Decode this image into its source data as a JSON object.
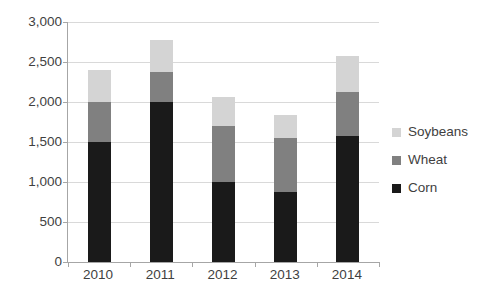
{
  "chart_data": {
    "type": "bar",
    "subtype": "stacked-bar",
    "title": "",
    "xlabel": "",
    "ylabel": "",
    "categories": [
      "2010",
      "2011",
      "2012",
      "2013",
      "2014"
    ],
    "series": [
      {
        "name": "Corn",
        "color": "#1a1a1a",
        "values": [
          1500,
          2000,
          1000,
          880,
          1580
        ]
      },
      {
        "name": "Wheat",
        "color": "#808080",
        "values": [
          500,
          380,
          700,
          670,
          540
        ]
      },
      {
        "name": "Soybeans",
        "color": "#d4d4d4",
        "values": [
          400,
          400,
          360,
          290,
          460
        ]
      }
    ],
    "totals": [
      2400,
      2780,
      2060,
      1840,
      2580
    ],
    "ylim": [
      0,
      3000
    ],
    "ytick_values": [
      0,
      500,
      1000,
      1500,
      2000,
      2500,
      3000
    ],
    "ytick_labels": [
      "0",
      "500",
      "1,000",
      "1,500",
      "2,000",
      "2,500",
      "3,000"
    ],
    "grid": true,
    "legend_position": "right",
    "legend_entries": [
      "Soybeans",
      "Wheat",
      "Corn"
    ]
  },
  "axis": {
    "line_color": "#a6a6a6",
    "grid_color": "#d9d9d9"
  }
}
